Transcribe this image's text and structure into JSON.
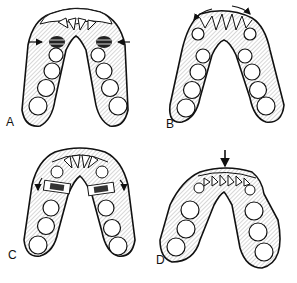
{
  "figure": {
    "panels": [
      {
        "id": "A",
        "label": "A",
        "description": "Lower arch with inward arrows at premolar bands (constriction)"
      },
      {
        "id": "B",
        "label": "B",
        "description": "Lower arch with curved arrows along anterior segment (expansion of anterior arc)"
      },
      {
        "id": "C",
        "label": "C",
        "description": "Lower arch with banded premolars and distal curved arrows"
      },
      {
        "id": "D",
        "label": "D",
        "description": "Lower arch with downward arrow at incisors"
      }
    ],
    "colors": {
      "ink": "#111111",
      "background": "#ffffff",
      "hatch": "#555555"
    }
  }
}
